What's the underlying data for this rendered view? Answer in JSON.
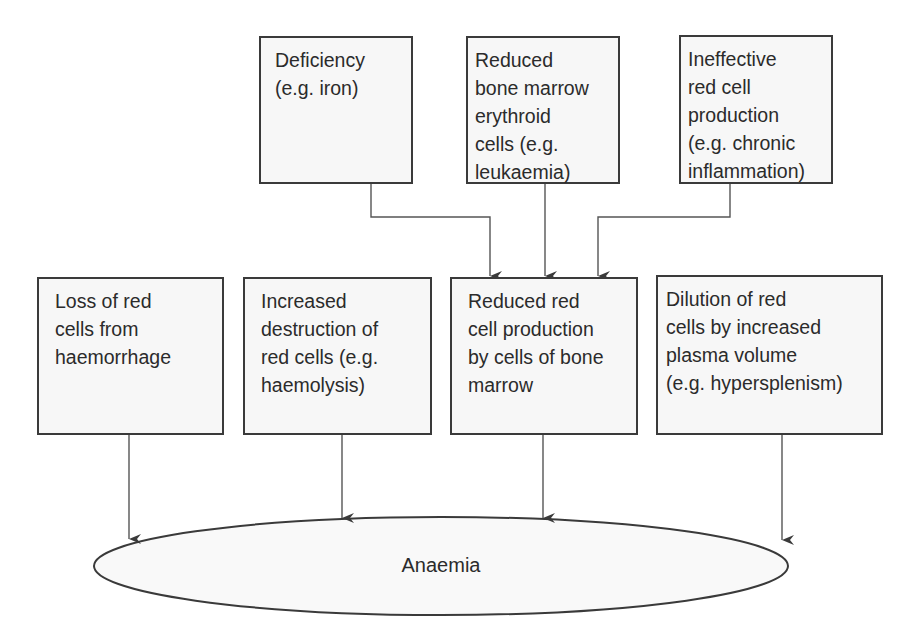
{
  "diagram": {
    "colors": {
      "box_border": "#3a3a3a",
      "box_fill": "#f7f7f7",
      "line": "#555555",
      "text": "#2b2b2b"
    },
    "top_row": [
      {
        "id": "deficiency",
        "text": "Deficiency\n(e.g. iron)"
      },
      {
        "id": "reduced-erythroid",
        "text": "Reduced\nbone marrow\nerythroid\ncells (e.g.\nleukaemia)"
      },
      {
        "id": "ineffective-production",
        "text": "Ineffective\nred cell\nproduction\n(e.g. chronic\ninflammation)"
      }
    ],
    "middle_row": [
      {
        "id": "loss-haemorrhage",
        "text": "Loss of red\ncells from\nhaemorrhage"
      },
      {
        "id": "increased-destruction",
        "text": "Increased\ndestruction of\nred cells (e.g.\nhaemolysis)"
      },
      {
        "id": "reduced-production",
        "text": "Reduced red\ncell production\nby cells of bone\nmarrow"
      },
      {
        "id": "dilution",
        "text": "Dilution of red\ncells by increased\nplasma volume\n(e.g. hypersplenism)"
      }
    ],
    "outcome": {
      "id": "anaemia",
      "text": "Anaemia"
    },
    "edges": [
      {
        "from": "deficiency",
        "to": "reduced-production"
      },
      {
        "from": "reduced-erythroid",
        "to": "reduced-production"
      },
      {
        "from": "ineffective-production",
        "to": "reduced-production"
      },
      {
        "from": "loss-haemorrhage",
        "to": "anaemia"
      },
      {
        "from": "increased-destruction",
        "to": "anaemia"
      },
      {
        "from": "reduced-production",
        "to": "anaemia"
      },
      {
        "from": "dilution",
        "to": "anaemia"
      }
    ]
  }
}
